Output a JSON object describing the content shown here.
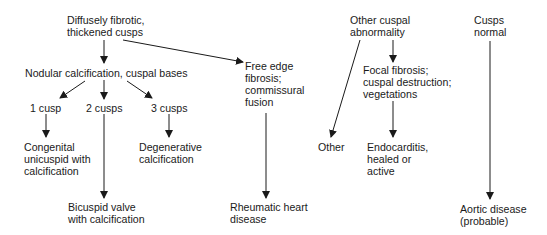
{
  "diagram": {
    "nodes": {
      "diffusely_fibrotic": [
        "Diffusely fibrotic,",
        "thickened cusps"
      ],
      "nodular_calcification": [
        "Nodular calcification, cuspal bases"
      ],
      "one_cusp": [
        "1 cusp"
      ],
      "two_cusps": [
        "2 cusps"
      ],
      "three_cusps": [
        "3 cusps"
      ],
      "congenital_unicuspid": [
        "Congenital",
        "unicuspid with",
        "calcification"
      ],
      "degenerative_calcification": [
        "Degenerative",
        "calcification"
      ],
      "bicuspid_valve": [
        "Bicuspid valve",
        "with calcification"
      ],
      "free_edge_fibrosis": [
        "Free edge",
        "fibrosis;",
        "commissural",
        "fusion"
      ],
      "rheumatic_heart_disease": [
        "Rheumatic heart",
        "disease"
      ],
      "other_cuspal_abnormality": [
        "Other cuspal",
        "abnormality"
      ],
      "other": [
        "Other"
      ],
      "focal_fibrosis": [
        "Focal fibrosis;",
        "cuspal destruction;",
        "vegetations"
      ],
      "endocarditis": [
        "Endocarditis,",
        "healed or",
        "active"
      ],
      "cusps_normal": [
        "Cusps",
        "normal"
      ],
      "aortic_disease": [
        "Aortic disease",
        "(probable)"
      ]
    },
    "edges": [
      {
        "from": "diffusely_fibrotic",
        "to": "nodular_calcification"
      },
      {
        "from": "diffusely_fibrotic",
        "to": "free_edge_fibrosis"
      },
      {
        "from": "nodular_calcification",
        "to": "one_cusp"
      },
      {
        "from": "nodular_calcification",
        "to": "two_cusps"
      },
      {
        "from": "nodular_calcification",
        "to": "three_cusps"
      },
      {
        "from": "one_cusp",
        "to": "congenital_unicuspid"
      },
      {
        "from": "two_cusps",
        "to": "bicuspid_valve"
      },
      {
        "from": "three_cusps",
        "to": "degenerative_calcification"
      },
      {
        "from": "free_edge_fibrosis",
        "to": "rheumatic_heart_disease"
      },
      {
        "from": "other_cuspal_abnormality",
        "to": "other"
      },
      {
        "from": "other_cuspal_abnormality",
        "to": "focal_fibrosis"
      },
      {
        "from": "focal_fibrosis",
        "to": "endocarditis"
      },
      {
        "from": "cusps_normal",
        "to": "aortic_disease"
      }
    ],
    "colors": {
      "line": "#1a1a1a",
      "text": "#1a1a1a",
      "background": "#ffffff"
    }
  }
}
